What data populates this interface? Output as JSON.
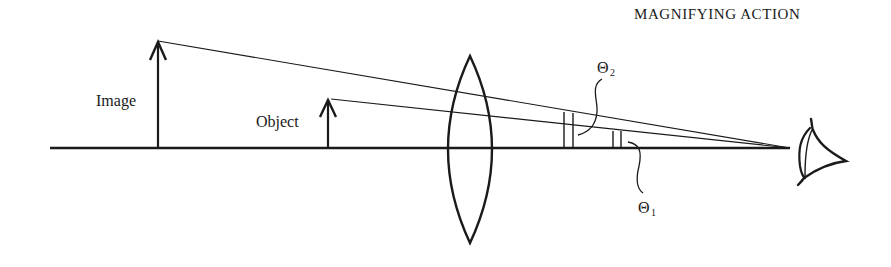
{
  "title": "MAGNIFYING ACTION",
  "labels": {
    "image": "Image",
    "object": "Object",
    "theta2": {
      "symbol": "Θ",
      "subscript": "2"
    },
    "theta1": {
      "symbol": "Θ",
      "subscript": "1"
    }
  },
  "elements": {
    "optical_axis": "optical axis",
    "lens": "converging lens",
    "eye": "eye",
    "image_arrow": "virtual image arrow",
    "object_arrow": "object arrow"
  },
  "colors": {
    "ink": "#1a1a1a",
    "background": "#ffffff"
  }
}
